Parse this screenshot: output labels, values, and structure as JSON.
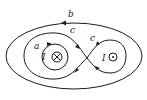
{
  "diagram": {
    "type": "ampere-loops",
    "labels": {
      "outer_loop": "b",
      "figure_eight_left": "c",
      "figure_eight_right": "c",
      "inner_loop": "a",
      "current_left": "I",
      "current_right": "I"
    },
    "current_left_direction": "into-page",
    "current_right_direction": "out-of-page",
    "colors": {
      "line": "#1a1a1a",
      "background": "#ffffff"
    }
  }
}
